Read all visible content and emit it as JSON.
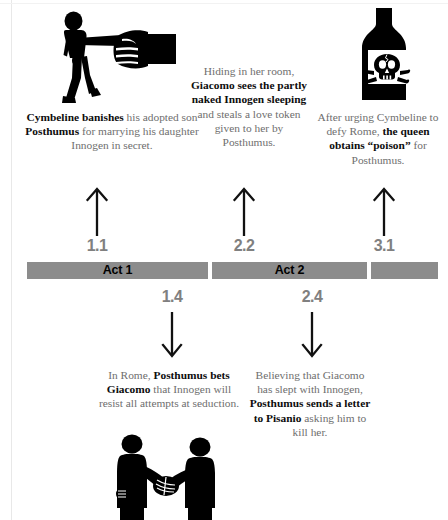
{
  "figure": {
    "title_visible": false,
    "colors": {
      "bar_gray": "#8c8c8c",
      "scene_number_gray": "#808080",
      "body_text_gray": "#6e6e6e",
      "bold_text_black": "#0d0d0d",
      "icon_black": "#000000"
    }
  },
  "timeline": {
    "segments": [
      {
        "label": "Act 1"
      },
      {
        "label": "Act 2"
      },
      {
        "label": ""
      }
    ]
  },
  "scenes_above": [
    {
      "number": "1.1"
    },
    {
      "number": "2.2"
    },
    {
      "number": "3.1"
    }
  ],
  "scenes_below": [
    {
      "number": "1.4"
    },
    {
      "number": "2.4"
    }
  ],
  "panels_top": [
    {
      "icon": "banished-man-pointing-hand-icon",
      "caption_parts": [
        {
          "text": "Cymbeline banishes",
          "bold": true
        },
        {
          "text": " his adopted son ",
          "bold": false
        },
        {
          "text": "Posthumus",
          "bold": true
        },
        {
          "text": " for marrying his daughter Innogen in secret.",
          "bold": false
        }
      ]
    },
    {
      "icon": "none",
      "caption_parts": [
        {
          "text": "Hiding in her room, ",
          "bold": false
        },
        {
          "text": "Giacomo sees the partly naked Innogen sleeping",
          "bold": true
        },
        {
          "text": " and steals a love token given to her by Posthumus.",
          "bold": false
        }
      ]
    },
    {
      "icon": "poison-bottle-skull-icon",
      "caption_parts": [
        {
          "text": "After urging Cymbeline to defy Rome, ",
          "bold": false
        },
        {
          "text": "the queen obtains “poison”",
          "bold": true
        },
        {
          "text": " for Posthumus.",
          "bold": false
        }
      ]
    }
  ],
  "panels_bottom": [
    {
      "icon": "handshake-two-men-icon",
      "caption_parts": [
        {
          "text": "In Rome, ",
          "bold": false
        },
        {
          "text": "Posthumus bets Giacomo",
          "bold": true
        },
        {
          "text": " that Innogen will resist all attempts at seduction.",
          "bold": false
        }
      ]
    },
    {
      "icon": "none",
      "caption_parts": [
        {
          "text": "Believing that Giacomo has slept with Innogen, ",
          "bold": false
        },
        {
          "text": "Posthumus sends a letter to Pisanio",
          "bold": true
        },
        {
          "text": " asking him to kill her.",
          "bold": false
        }
      ]
    }
  ]
}
